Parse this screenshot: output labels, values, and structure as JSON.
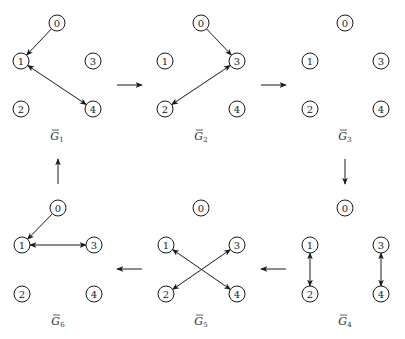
{
  "diagram": {
    "colors": {
      "stroke": "#1a1a1a",
      "background": "#ffffff",
      "label": "#333333"
    },
    "node_radius": 8,
    "graphs": [
      {
        "id": "G1",
        "label_base": "G",
        "label_sub": "1",
        "label_x": 57,
        "label_y": 140,
        "nodes": [
          {
            "id": "0",
            "x": 57,
            "y": 23
          },
          {
            "id": "1",
            "x": 21,
            "y": 61
          },
          {
            "id": "2",
            "x": 21,
            "y": 109
          },
          {
            "id": "3",
            "x": 93,
            "y": 61
          },
          {
            "id": "4",
            "x": 93,
            "y": 109
          }
        ],
        "edges": [
          {
            "from": "0",
            "to": "1",
            "directed": "forward"
          },
          {
            "from": "1",
            "to": "4",
            "directed": "both"
          }
        ]
      },
      {
        "id": "G2",
        "label_base": "G",
        "label_sub": "2",
        "label_x": 201,
        "label_y": 140,
        "nodes": [
          {
            "id": "0",
            "x": 201,
            "y": 23
          },
          {
            "id": "1",
            "x": 165,
            "y": 61
          },
          {
            "id": "2",
            "x": 165,
            "y": 109
          },
          {
            "id": "3",
            "x": 237,
            "y": 61
          },
          {
            "id": "4",
            "x": 237,
            "y": 109
          }
        ],
        "edges": [
          {
            "from": "0",
            "to": "3",
            "directed": "forward"
          },
          {
            "from": "3",
            "to": "2",
            "directed": "both"
          }
        ]
      },
      {
        "id": "G3",
        "label_base": "G",
        "label_sub": "3",
        "label_x": 345,
        "label_y": 140,
        "nodes": [
          {
            "id": "0",
            "x": 345,
            "y": 23
          },
          {
            "id": "1",
            "x": 310,
            "y": 61
          },
          {
            "id": "2",
            "x": 310,
            "y": 109
          },
          {
            "id": "3",
            "x": 381,
            "y": 61
          },
          {
            "id": "4",
            "x": 381,
            "y": 109
          }
        ],
        "edges": []
      },
      {
        "id": "G4",
        "label_base": "G",
        "label_sub": "4",
        "label_x": 345,
        "label_y": 325,
        "nodes": [
          {
            "id": "0",
            "x": 345,
            "y": 208
          },
          {
            "id": "1",
            "x": 310,
            "y": 245
          },
          {
            "id": "2",
            "x": 310,
            "y": 294
          },
          {
            "id": "3",
            "x": 381,
            "y": 245
          },
          {
            "id": "4",
            "x": 381,
            "y": 294
          }
        ],
        "edges": [
          {
            "from": "1",
            "to": "2",
            "directed": "both"
          },
          {
            "from": "3",
            "to": "4",
            "directed": "both"
          }
        ]
      },
      {
        "id": "G5",
        "label_base": "G",
        "label_sub": "5",
        "label_x": 201,
        "label_y": 325,
        "nodes": [
          {
            "id": "0",
            "x": 201,
            "y": 208
          },
          {
            "id": "1",
            "x": 166,
            "y": 245
          },
          {
            "id": "2",
            "x": 166,
            "y": 294
          },
          {
            "id": "3",
            "x": 237,
            "y": 245
          },
          {
            "id": "4",
            "x": 237,
            "y": 294
          }
        ],
        "edges": [
          {
            "from": "1",
            "to": "4",
            "directed": "both"
          },
          {
            "from": "3",
            "to": "2",
            "directed": "both"
          }
        ]
      },
      {
        "id": "G6",
        "label_base": "G",
        "label_sub": "6",
        "label_x": 58,
        "label_y": 325,
        "nodes": [
          {
            "id": "0",
            "x": 58,
            "y": 208
          },
          {
            "id": "1",
            "x": 22,
            "y": 245
          },
          {
            "id": "2",
            "x": 22,
            "y": 294
          },
          {
            "id": "3",
            "x": 94,
            "y": 245
          },
          {
            "id": "4",
            "x": 94,
            "y": 294
          }
        ],
        "edges": [
          {
            "from": "0",
            "to": "1",
            "directed": "forward"
          },
          {
            "from": "1",
            "to": "3",
            "directed": "both"
          }
        ]
      }
    ],
    "transitions": [
      {
        "from": "G1",
        "to": "G2",
        "x1": 117,
        "y1": 85,
        "x2": 142,
        "y2": 85
      },
      {
        "from": "G2",
        "to": "G3",
        "x1": 261,
        "y1": 85,
        "x2": 286,
        "y2": 85
      },
      {
        "from": "G3",
        "to": "G4",
        "x1": 345,
        "y1": 159,
        "x2": 345,
        "y2": 184
      },
      {
        "from": "G4",
        "to": "G5",
        "x1": 286,
        "y1": 269,
        "x2": 261,
        "y2": 269
      },
      {
        "from": "G5",
        "to": "G6",
        "x1": 142,
        "y1": 269,
        "x2": 117,
        "y2": 269
      },
      {
        "from": "G6",
        "to": "G1",
        "x1": 58,
        "y1": 184,
        "x2": 58,
        "y2": 159
      }
    ]
  }
}
